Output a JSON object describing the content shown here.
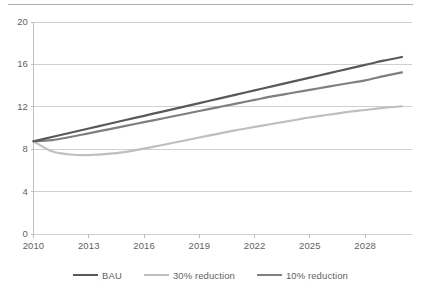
{
  "chart_data": {
    "type": "line",
    "title": "",
    "subtitle": "",
    "xlabel": "",
    "ylabel": "",
    "xlim": [
      2010,
      2030
    ],
    "ylim": [
      0,
      20
    ],
    "yticks": [
      0,
      4,
      8,
      12,
      16,
      20
    ],
    "ytick_labels": [
      "0",
      "4",
      "8",
      "12",
      "16",
      "20"
    ],
    "xticks": [
      2010,
      2013,
      2016,
      2019,
      2022,
      2025,
      2028
    ],
    "xtick_labels": [
      "2010",
      "2013",
      "2016",
      "2019",
      "2022",
      "2025",
      "2028"
    ],
    "grid": "horizontal",
    "legend_position": "bottom",
    "x": [
      2010,
      2011,
      2012,
      2013,
      2014,
      2015,
      2016,
      2017,
      2018,
      2019,
      2020,
      2021,
      2022,
      2023,
      2024,
      2025,
      2026,
      2027,
      2028,
      2029,
      2030
    ],
    "series": [
      {
        "name": "BAU",
        "color": "#595959",
        "values": [
          8.75,
          9.15,
          9.55,
          9.95,
          10.35,
          10.75,
          11.15,
          11.55,
          11.95,
          12.35,
          12.75,
          13.15,
          13.55,
          13.95,
          14.35,
          14.75,
          15.15,
          15.55,
          15.95,
          16.35,
          16.7
        ]
      },
      {
        "name": "30% reduction",
        "color": "#bfbfbf",
        "values": [
          8.75,
          7.8,
          7.5,
          7.45,
          7.55,
          7.75,
          8.05,
          8.4,
          8.75,
          9.1,
          9.45,
          9.8,
          10.1,
          10.4,
          10.7,
          11.0,
          11.25,
          11.5,
          11.7,
          11.9,
          12.05
        ]
      },
      {
        "name": "10% reduction",
        "color": "#7f7f7f",
        "values": [
          8.75,
          8.85,
          9.15,
          9.5,
          9.85,
          10.2,
          10.55,
          10.9,
          11.25,
          11.6,
          11.95,
          12.3,
          12.65,
          13.0,
          13.3,
          13.6,
          13.9,
          14.2,
          14.5,
          14.9,
          15.25
        ]
      }
    ],
    "colors": {
      "grid": "#d0d0d0",
      "axis": "#bfbfbf",
      "text": "#5f5f5f",
      "background": "#ffffff",
      "top_rule": "#aeaeae"
    }
  }
}
